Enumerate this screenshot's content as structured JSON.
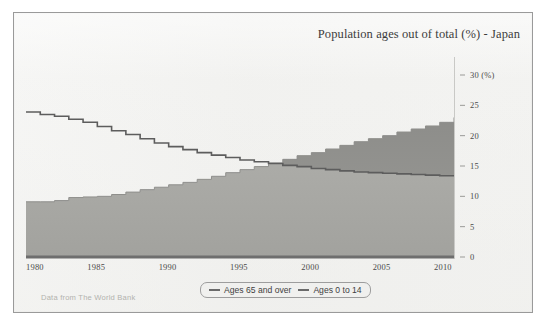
{
  "chart_data": {
    "type": "area",
    "title": "Population ages out of total (%) - Japan",
    "subtitle": "",
    "xlabel": "",
    "ylabel": "",
    "y_unit_label": "(%)",
    "source_note": "Data from The World Bank",
    "xlim": [
      1980,
      2010
    ],
    "ylim": [
      0,
      30
    ],
    "y_ticks": [
      0,
      5,
      10,
      15,
      20,
      25,
      30
    ],
    "x_ticks": [
      1980,
      1985,
      1990,
      1995,
      2000,
      2005,
      2010
    ],
    "grid": false,
    "legend_position": "bottom",
    "x": [
      1980,
      1981,
      1982,
      1983,
      1984,
      1985,
      1986,
      1987,
      1988,
      1989,
      1990,
      1991,
      1992,
      1993,
      1994,
      1995,
      1996,
      1997,
      1998,
      1999,
      2000,
      2001,
      2002,
      2003,
      2004,
      2005,
      2006,
      2007,
      2008,
      2009,
      2010
    ],
    "series": [
      {
        "name": "Ages 65 and over",
        "style": "area",
        "values": [
          9.1,
          9.1,
          9.3,
          9.8,
          9.9,
          10.0,
          10.3,
          10.7,
          11.1,
          11.5,
          11.9,
          12.3,
          12.8,
          13.3,
          13.9,
          14.4,
          14.9,
          15.5,
          16.1,
          16.7,
          17.2,
          17.8,
          18.4,
          19.0,
          19.5,
          20.0,
          20.6,
          21.1,
          21.6,
          22.2,
          23.0
        ]
      },
      {
        "name": "Ages 0 to 14",
        "style": "line",
        "values": [
          23.9,
          23.5,
          23.2,
          22.7,
          22.2,
          21.5,
          20.8,
          20.2,
          19.5,
          18.8,
          18.2,
          17.7,
          17.2,
          16.8,
          16.4,
          16.0,
          15.7,
          15.4,
          15.1,
          14.9,
          14.6,
          14.4,
          14.2,
          14.0,
          13.9,
          13.8,
          13.7,
          13.6,
          13.5,
          13.4,
          13.3
        ]
      }
    ]
  },
  "legend": {
    "entries": [
      {
        "label": "Ages 65 and over"
      },
      {
        "label": "Ages 0 to 14"
      }
    ]
  },
  "colors": {
    "area_lower": "#a9a9a5",
    "area_upper": "#8f8f8c",
    "line": "#5d5d5d",
    "axis": "#6e6e6e",
    "paper": "#f2f2f0",
    "frame": "#9a9a9a",
    "text": "#3c3c3c",
    "muted_text": "#b2b2ae"
  }
}
